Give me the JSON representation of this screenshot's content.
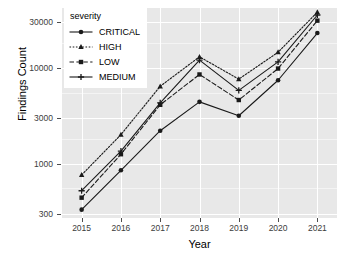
{
  "chart_data": {
    "type": "line",
    "title": "",
    "xlabel": "Year",
    "ylabel": "Findings Count",
    "legend_title": "severity",
    "legend_position": "top-left-inside",
    "grid": true,
    "yscale": "log",
    "ylim": [
      270,
      42000
    ],
    "ytick_labels": [
      "300",
      "1000",
      "3000",
      "10000",
      "30000"
    ],
    "ytick_values": [
      300,
      1000,
      3000,
      10000,
      30000
    ],
    "categories": [
      "2015",
      "2016",
      "2017",
      "2018",
      "2019",
      "2020",
      "2021"
    ],
    "x": [
      2015,
      2016,
      2017,
      2018,
      2019,
      2020,
      2021
    ],
    "series": [
      {
        "name": "CRITICAL",
        "values": [
          330,
          850,
          2200,
          4400,
          3150,
          7400,
          23000
        ],
        "linestyle": "solid",
        "marker": "circle",
        "color": "#1a1a1a"
      },
      {
        "name": "HIGH",
        "values": [
          760,
          2000,
          6400,
          13000,
          7600,
          14500,
          38000
        ],
        "linestyle": "dotted",
        "marker": "triangle",
        "color": "#1a1a1a"
      },
      {
        "name": "LOW",
        "values": [
          440,
          1250,
          4100,
          8500,
          4600,
          9800,
          31000
        ],
        "linestyle": "dashed",
        "marker": "square",
        "color": "#1a1a1a"
      },
      {
        "name": "MEDIUM",
        "values": [
          520,
          1350,
          4300,
          12000,
          5800,
          11500,
          35500
        ],
        "linestyle": "solid",
        "marker": "plus",
        "color": "#1a1a1a"
      }
    ]
  },
  "theme": {
    "panel_background": "#e8e8e8",
    "grid_major_color": "#ffffff",
    "grid_minor_color": "#f4f4f4",
    "text_color": "#3c3c3c",
    "line_color": "#1a1a1a",
    "page_background": "#ffffff"
  }
}
